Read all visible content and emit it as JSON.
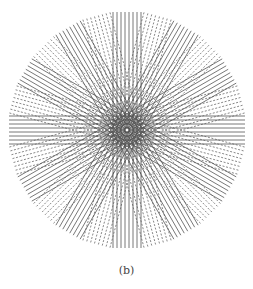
{
  "caption": "(b)",
  "figure": {
    "center": [
      127,
      130
    ],
    "radius": 113,
    "line_color": "#555555",
    "groups": {
      "angle_step_deg": 15,
      "count": 12,
      "lines_per_group": 8,
      "line_spacing_px": 4,
      "solid_angles_deg": [
        0,
        30,
        60,
        90,
        120,
        150
      ],
      "dashed_angles_deg": [
        15,
        45,
        75,
        105,
        135,
        165
      ]
    }
  }
}
